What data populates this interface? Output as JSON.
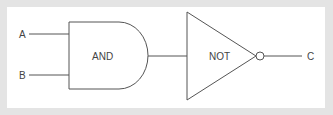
{
  "diagram": {
    "type": "logic-circuit",
    "inputs": [
      {
        "id": "A",
        "label": "A"
      },
      {
        "id": "B",
        "label": "B"
      }
    ],
    "gates": [
      {
        "id": "and",
        "label": "AND",
        "type": "AND"
      },
      {
        "id": "not",
        "label": "NOT",
        "type": "NOT"
      }
    ],
    "output": {
      "id": "C",
      "label": "C"
    },
    "connections": [
      {
        "from": "A",
        "to": "and"
      },
      {
        "from": "B",
        "to": "and"
      },
      {
        "from": "and",
        "to": "not"
      },
      {
        "from": "not",
        "to": "C"
      }
    ],
    "colors": {
      "frame": "#e4e4e4",
      "background": "#ffffff",
      "stroke": "#555555",
      "text": "#444444"
    }
  }
}
